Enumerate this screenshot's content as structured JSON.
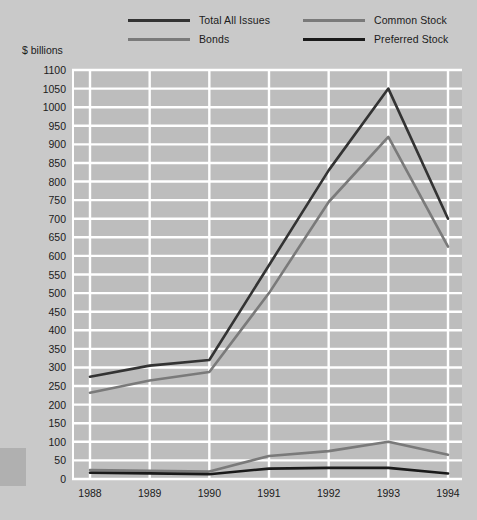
{
  "chart_data": {
    "type": "line",
    "title": "",
    "subtitle": "",
    "xlabel": "",
    "ylabel": "$ billions",
    "categories": [
      "1988",
      "1989",
      "1990",
      "1991",
      "1992",
      "1993",
      "1994"
    ],
    "x": [
      1988,
      1989,
      1990,
      1991,
      1992,
      1993,
      1994
    ],
    "ylim": [
      0,
      1100
    ],
    "ytick_step": 50,
    "yticks": [
      0,
      50,
      100,
      150,
      200,
      250,
      300,
      350,
      400,
      450,
      500,
      550,
      600,
      650,
      700,
      750,
      800,
      850,
      900,
      950,
      1000,
      1050,
      1100
    ],
    "grid": true,
    "grid_axis": "y",
    "legend_position": "top",
    "series": [
      {
        "name": "Total All Issues",
        "color": "#333333",
        "values": [
          275,
          305,
          320,
          575,
          830,
          1050,
          700
        ]
      },
      {
        "name": "Bonds",
        "color": "#7a7a7a",
        "values": [
          232,
          265,
          288,
          500,
          745,
          920,
          625
        ]
      },
      {
        "name": "Common Stock",
        "color": "#7a7a7a",
        "values": [
          24,
          22,
          20,
          62,
          75,
          100,
          65
        ]
      },
      {
        "name": "Preferred Stock",
        "color": "#1a1a1a",
        "values": [
          17,
          15,
          13,
          28,
          30,
          30,
          15
        ]
      }
    ]
  },
  "legend": {
    "items": [
      {
        "label": "Total All Issues",
        "color": "#333333"
      },
      {
        "label": "Bonds",
        "color": "#7a7a7a"
      },
      {
        "label": "Common Stock",
        "color": "#7a7a7a"
      },
      {
        "label": "Preferred Stock",
        "color": "#1a1a1a"
      }
    ]
  },
  "axis": {
    "y_title": "$ billions"
  },
  "style": {
    "page_background": "#c9c9c9",
    "plot_background": "#bdbdbd",
    "gridline_color": "#ffffff",
    "text_color": "#1b1b1b"
  }
}
